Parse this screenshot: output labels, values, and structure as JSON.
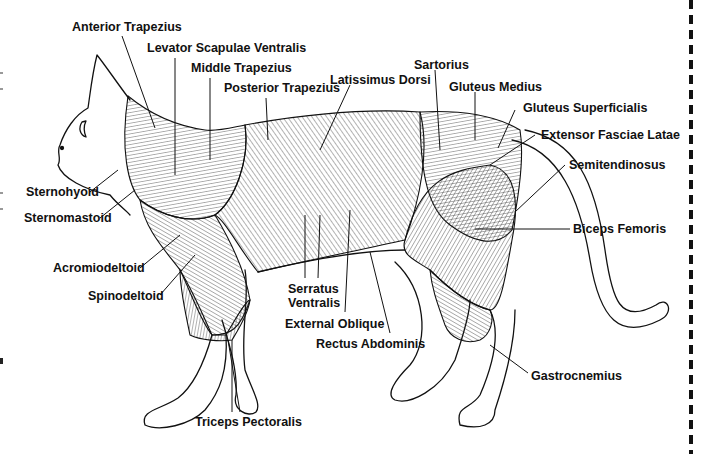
{
  "diagram": {
    "labels": [
      {
        "id": "anterior-trapezius",
        "text": "Anterior Trapezius",
        "x": 72,
        "y": 27
      },
      {
        "id": "levator-scapulae-ventralis",
        "text": "Levator Scapulae Ventralis",
        "x": 147,
        "y": 47
      },
      {
        "id": "middle-trapezius",
        "text": "Middle Trapezius",
        "x": 191,
        "y": 68
      },
      {
        "id": "posterior-trapezius",
        "text": "Posterior Trapezius",
        "x": 224,
        "y": 88
      },
      {
        "id": "latissimus-dorsi",
        "text": "Latissimus Dorsi",
        "x": 330,
        "y": 74
      },
      {
        "id": "sartorius",
        "text": "Sartorius",
        "x": 414,
        "y": 59
      },
      {
        "id": "gluteus-medius",
        "text": "Gluteus Medius",
        "x": 449,
        "y": 81
      },
      {
        "id": "gluteus-superficialis",
        "text": "Gluteus Superficialis",
        "x": 523,
        "y": 102
      },
      {
        "id": "extensor-fasciae-latae",
        "text": "Extensor Fasciae Latae",
        "x": 541,
        "y": 129
      },
      {
        "id": "semitendinosus",
        "text": "Semitendinosus",
        "x": 569,
        "y": 159
      },
      {
        "id": "biceps-femoris",
        "text": "Biceps Femoris",
        "x": 573,
        "y": 222
      },
      {
        "id": "sternohyoid",
        "text": "Sternohyoid",
        "x": 26,
        "y": 186
      },
      {
        "id": "sternomastoid",
        "text": "Sternomastoid",
        "x": 24,
        "y": 212
      },
      {
        "id": "acromiodeltoid",
        "text": "Acromiodeltoid",
        "x": 53,
        "y": 262
      },
      {
        "id": "spinodeltoid",
        "text": "Spinodeltoid",
        "x": 88,
        "y": 290
      },
      {
        "id": "serratus-ventralis",
        "text": "Serratus\nVentralis",
        "x": 288,
        "y": 283
      },
      {
        "id": "external-oblique",
        "text": "External Oblique",
        "x": 285,
        "y": 318
      },
      {
        "id": "rectus-abdominis",
        "text": "Rectus Abdominis",
        "x": 316,
        "y": 338
      },
      {
        "id": "gastrocnemius",
        "text": "Gastrocnemius",
        "x": 531,
        "y": 370
      },
      {
        "id": "triceps-pectoralis",
        "text": "Triceps Pectoralis",
        "x": 195,
        "y": 415
      }
    ]
  },
  "colors": {
    "ink": "#111111",
    "background": "#ffffff"
  }
}
